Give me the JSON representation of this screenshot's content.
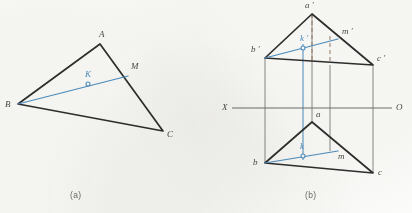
{
  "figure": {
    "background_color": "#fcfcfa",
    "ink_color": "#2e2e2c",
    "blue_color": "#4e8fc0",
    "thin_color": "#7d7d79",
    "dash_color": "#9a7b63"
  },
  "panel_a": {
    "caption": "(a)",
    "caption_pos": {
      "x": 70,
      "y": 190
    },
    "vertices": [
      {
        "name": "B",
        "label": "B",
        "x": 18,
        "y": 104,
        "label_x": 5,
        "label_y": 100,
        "color": "ink"
      },
      {
        "name": "A",
        "label": "A",
        "x": 100,
        "y": 44,
        "label_x": 99,
        "label_y": 30,
        "color": "ink"
      },
      {
        "name": "C",
        "label": "C",
        "x": 163,
        "y": 131,
        "label_x": 167,
        "label_y": 130,
        "color": "ink"
      }
    ],
    "outline": "M18,104 L100,44 L163,131 Z",
    "line_bm": {
      "from": "B",
      "to": "M",
      "x1": 18,
      "y1": 104,
      "x2": 128,
      "y2": 76
    },
    "point_m": {
      "label": "M",
      "x": 128,
      "y": 76,
      "label_x": 131,
      "label_y": 62
    },
    "point_k": {
      "label": "K",
      "x": 88,
      "y": 84,
      "label_x": 85,
      "label_y": 70,
      "radius": 2
    }
  },
  "panel_b": {
    "caption": "(b)",
    "caption_pos": {
      "x": 305,
      "y": 190
    },
    "ground_line": {
      "label_left": "X",
      "label_right": "O",
      "y": 108,
      "x1": 232,
      "x2": 392,
      "label_left_x": 222,
      "label_left_y": 103,
      "label_right_x": 396,
      "label_right_y": 103
    },
    "frontal_view": {
      "outline": "M312,14 L265,58 L373,65 Z",
      "vertices": [
        {
          "name": "a-prime",
          "label": "a ′",
          "x": 312,
          "y": 14,
          "label_x": 305,
          "label_y": 1
        },
        {
          "name": "b-prime",
          "label": "b ′",
          "x": 265,
          "y": 58,
          "label_x": 251,
          "label_y": 45
        },
        {
          "name": "c-prime",
          "label": "c ′",
          "x": 373,
          "y": 65,
          "label_x": 377,
          "label_y": 54
        }
      ],
      "line_bm": {
        "x1": 265,
        "y1": 58,
        "x2": 338,
        "y2": 39
      },
      "point_m": {
        "label": "m ′",
        "x": 338,
        "y": 39,
        "label_x": 342,
        "label_y": 27
      },
      "point_k": {
        "label": "k ′",
        "x": 303,
        "y": 48,
        "label_x": 300,
        "label_y": 34,
        "radius": 2
      }
    },
    "horizontal_view": {
      "outline": "M312,122 L265,163 L373,173 Z",
      "vertices": [
        {
          "name": "a",
          "label": "a",
          "x": 312,
          "y": 122,
          "label_x": 316,
          "label_y": 110
        },
        {
          "name": "b",
          "label": "b",
          "x": 265,
          "y": 163,
          "label_x": 253,
          "label_y": 158
        },
        {
          "name": "c",
          "label": "c",
          "x": 373,
          "y": 173,
          "label_x": 378,
          "label_y": 168
        }
      ],
      "line_bm": {
        "x1": 265,
        "y1": 163,
        "x2": 338,
        "y2": 151
      },
      "point_m": {
        "label": "m",
        "x": 338,
        "y": 151,
        "label_x": 338,
        "label_y": 152
      },
      "point_k": {
        "label": "k",
        "x": 303,
        "y": 156,
        "label_x": 300,
        "label_y": 142,
        "radius": 2
      }
    },
    "projection_lines": [
      {
        "name": "projector-b",
        "x": 265,
        "y1": 58,
        "y2": 163,
        "style": "thin"
      },
      {
        "name": "projector-a",
        "x": 312,
        "y1": 14,
        "y2": 122,
        "style": "thin"
      },
      {
        "name": "projector-m",
        "x": 330,
        "y1": 65,
        "y2": 151,
        "style": "thin"
      },
      {
        "name": "projector-c",
        "x": 373,
        "y1": 65,
        "y2": 173,
        "style": "thin"
      },
      {
        "name": "projector-k",
        "x": 303,
        "y1": 44,
        "y2": 160,
        "style": "blue"
      },
      {
        "name": "dashed-a",
        "x": 312,
        "y1": 14,
        "y2": 62,
        "style": "dashed"
      },
      {
        "name": "dashed-m",
        "x": 330,
        "y1": 36,
        "y2": 62,
        "style": "dashed"
      }
    ]
  }
}
